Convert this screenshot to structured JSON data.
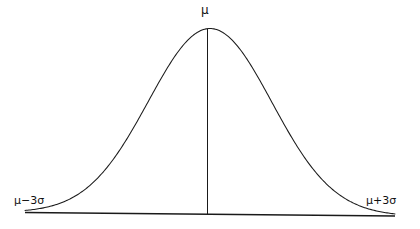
{
  "figure": {
    "type": "normal-distribution-curve",
    "background_color": "#ffffff",
    "stroke_color": "#1a1a1a",
    "labels": {
      "center": "μ",
      "left": "μ−3σ",
      "right": "μ+3σ"
    }
  },
  "chart_data": {
    "type": "line",
    "title": "",
    "subtitle": "",
    "xlabel": "",
    "ylabel": "",
    "grid": false,
    "legend": false,
    "annotations": [
      {
        "text": "μ",
        "x": 0,
        "y": 1.0,
        "position": "above-peak"
      },
      {
        "text": "μ−3σ",
        "x": -3,
        "y": 0,
        "position": "above-left-baseline"
      },
      {
        "text": "μ+3σ",
        "x": 3,
        "y": 0,
        "position": "above-right-baseline"
      }
    ],
    "xlim": [
      -3,
      3
    ],
    "ylim": [
      0,
      1
    ],
    "xtick_labels": [
      "μ−3σ",
      "μ",
      "μ+3σ"
    ],
    "xticks": [
      -3,
      0,
      3
    ],
    "ytick_labels": [],
    "series": [
      {
        "name": "normal-density",
        "x": [
          -3.0,
          -2.75,
          -2.5,
          -2.25,
          -2.0,
          -1.75,
          -1.5,
          -1.25,
          -1.0,
          -0.75,
          -0.5,
          -0.25,
          0.0,
          0.25,
          0.5,
          0.75,
          1.0,
          1.25,
          1.5,
          1.75,
          2.0,
          2.25,
          2.5,
          2.75,
          3.0
        ],
        "y": [
          0.011,
          0.022,
          0.044,
          0.079,
          0.135,
          0.216,
          0.325,
          0.458,
          0.607,
          0.755,
          0.882,
          0.969,
          1.0,
          0.969,
          0.882,
          0.755,
          0.607,
          0.458,
          0.325,
          0.216,
          0.135,
          0.079,
          0.044,
          0.022,
          0.011
        ]
      }
    ],
    "vertical_line": {
      "name": "mean-line",
      "x": 0,
      "y_from": 0,
      "y_to": 1.0
    },
    "baseline": {
      "name": "x-axis",
      "x_from": -3,
      "x_to": 3,
      "y": 0
    }
  }
}
